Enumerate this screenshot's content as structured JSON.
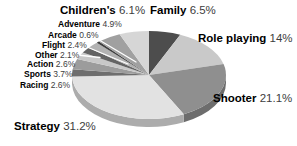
{
  "chart_data": {
    "type": "pie",
    "legend_position": "around-slices",
    "start_angle_deg_clockwise_from_top": 0,
    "slices": [
      {
        "label": "Family",
        "pct": 6.5,
        "pct_text": "6.5%",
        "color": "#4d4d4d",
        "label_x": 150,
        "label_y": 4,
        "font_px": 11.5
      },
      {
        "label": "Role playing",
        "pct": 14,
        "pct_text": "14%",
        "color": "#c9c9c9",
        "label_x": 198,
        "label_y": 32,
        "font_px": 11.5
      },
      {
        "label": "Shooter",
        "pct": 21.1,
        "pct_text": "21.1%",
        "color": "#8f8f8f",
        "label_x": 213,
        "label_y": 92,
        "font_px": 11.5
      },
      {
        "label": "Strategy",
        "pct": 31.2,
        "pct_text": "31.2%",
        "color": "#e2e2e2",
        "label_x": 14,
        "label_y": 120,
        "font_px": 11.5
      },
      {
        "label": "Racing",
        "pct": 2.6,
        "pct_text": "2.6%",
        "color": "#6e6e6e",
        "label_x": 20,
        "label_y": 81,
        "font_px": 8.5
      },
      {
        "label": "Sports",
        "pct": 3.7,
        "pct_text": "3.7%",
        "color": "#9c9c9c",
        "label_x": 24,
        "label_y": 70,
        "font_px": 8.5
      },
      {
        "label": "Action",
        "pct": 2.6,
        "pct_text": "2.6%",
        "color": "#c8c8c8",
        "label_x": 27,
        "label_y": 60,
        "font_px": 8.5
      },
      {
        "label": "Other",
        "pct": 2.1,
        "pct_text": "2.1%",
        "color": "#646464",
        "label_x": 35,
        "label_y": 50.5,
        "font_px": 8.5
      },
      {
        "label": "Flight",
        "pct": 2.4,
        "pct_text": "2.4%",
        "color": "#b2b2b2",
        "label_x": 42,
        "label_y": 40.5,
        "font_px": 8.5
      },
      {
        "label": "Arcade",
        "pct": 0.6,
        "pct_text": "0.6%",
        "color": "#3f3f3f",
        "label_x": 48,
        "label_y": 30.5,
        "font_px": 8.5
      },
      {
        "label": "Adventure",
        "pct": 4.9,
        "pct_text": "4.9%",
        "color": "#a0a0a0",
        "label_x": 58,
        "label_y": 20,
        "font_px": 8.5
      },
      {
        "label": "Children's",
        "pct": 6.1,
        "pct_text": "6.1%",
        "color": "#d6d6d6",
        "label_x": 60,
        "label_y": 4,
        "font_px": 11.5
      }
    ],
    "geometry": {
      "cx": 149,
      "cy": 75,
      "rx": 77,
      "ry": 44,
      "depth": 8,
      "rim_darken": 0.76
    },
    "leader_lines": [
      {
        "from_label": "Arcade",
        "x1": 90,
        "y1": 34.5,
        "x2": 136,
        "y2": 62
      },
      {
        "from_label": "Flight",
        "x1": 81,
        "y1": 44.5,
        "x2": 128,
        "y2": 64
      },
      {
        "from_label": "Other",
        "x1": 73,
        "y1": 54.5,
        "x2": 100,
        "y2": 57.5
      }
    ],
    "colors": {
      "background": "#ffffff",
      "label_name_text": "#000000",
      "label_pct_text": "#3d3d3d",
      "leader_line": "#ffffff"
    }
  }
}
